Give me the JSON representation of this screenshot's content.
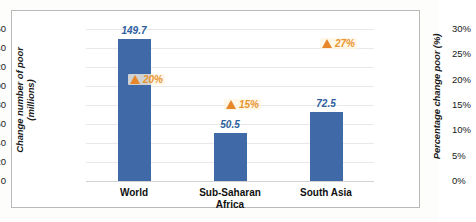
{
  "chart_data": {
    "type": "bar",
    "title": "",
    "categories": [
      "World",
      "Sub-Saharan Africa",
      "South Asia"
    ],
    "category_lines": [
      [
        "World"
      ],
      [
        "Sub-Saharan",
        "Africa"
      ],
      [
        "South Asia"
      ]
    ],
    "series": [
      {
        "name": "Change number of poor (millions)",
        "type": "bar",
        "axis": "left",
        "values": [
          149.7,
          50.5,
          72.5
        ],
        "labels": [
          "149.7",
          "50.5",
          "72.5"
        ],
        "color": "#4069a8"
      },
      {
        "name": "Percentage change poor (%)",
        "type": "marker",
        "axis": "right",
        "values": [
          20,
          15,
          27
        ],
        "labels": [
          "20%",
          "15%",
          "27%"
        ],
        "color": "#e8862a",
        "marker": "triangle-up-icon"
      }
    ],
    "ylabel": "Change number of poor (millions)",
    "ylabel_lines": [
      "Change number of poor",
      "(millions)"
    ],
    "y2label": "Percentage change poor (%)",
    "xlabel": "",
    "ylim": [
      0,
      160
    ],
    "y2lim": [
      0,
      30
    ],
    "yticks": [
      "0",
      "20",
      "40",
      "60",
      "80",
      "100",
      "120",
      "140",
      "160"
    ],
    "ytick_values": [
      0,
      20,
      40,
      60,
      80,
      100,
      120,
      140,
      160
    ],
    "y2ticks": [
      "0%",
      "5%",
      "10%",
      "15%",
      "20%",
      "25%",
      "30%"
    ],
    "y2tick_values": [
      0,
      5,
      10,
      15,
      20,
      25,
      30
    ],
    "grid": true,
    "legend": "none"
  }
}
